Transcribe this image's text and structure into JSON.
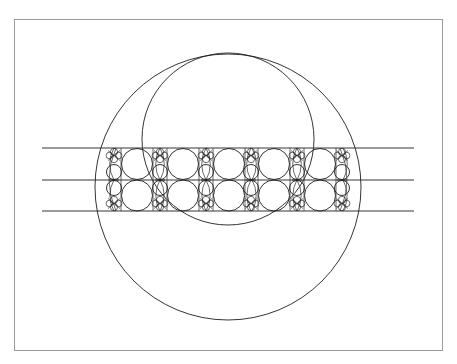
{
  "figure": {
    "caption_fragment": "",
    "frame": {
      "x": 14,
      "y": 19,
      "width": 429,
      "height": 332,
      "border_color": "#9a9a9a"
    },
    "stroke_color": "#1e1e1e",
    "large_circle": {
      "cx": 228,
      "cy": 187,
      "r": 133
    },
    "upper_circle": {
      "cx": 228,
      "cy": 139,
      "r": 86
    },
    "horizontal_lines": [
      {
        "y": 148,
        "x1": 42,
        "x2": 414
      },
      {
        "y": 180,
        "x1": 42,
        "x2": 414
      },
      {
        "y": 211,
        "x1": 42,
        "x2": 414
      }
    ],
    "band": {
      "top": 148,
      "middle": 180,
      "bottom": 211,
      "cell_centers_x": [
        137,
        183,
        229,
        274,
        320
      ],
      "cell_half_width": 16,
      "big_circle_r": 15.5,
      "divider_centers_x": [
        114,
        160,
        206,
        251,
        297,
        342
      ],
      "divider_medium_r": 7.5,
      "divider_small_r": 3.6,
      "outer_arc_left_x": 106,
      "outer_arc_right_x": 350
    }
  }
}
